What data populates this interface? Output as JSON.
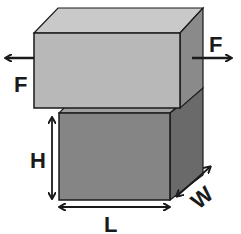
{
  "diagram": {
    "type": "shear test of a rectangular block",
    "labels": {
      "force_left": "F",
      "force_right": "F",
      "height": "H",
      "length": "L",
      "width": "W"
    },
    "colors": {
      "top_block_front": "#b8b8b8",
      "top_block_top": "#c9c9c9",
      "top_block_side": "#8a8a8a",
      "bottom_block_front": "#858585",
      "bottom_block_top": "#a0a0a0",
      "bottom_block_side": "#6a6a6a",
      "outline": "#1a1a1a",
      "background": "#ffffff"
    }
  }
}
